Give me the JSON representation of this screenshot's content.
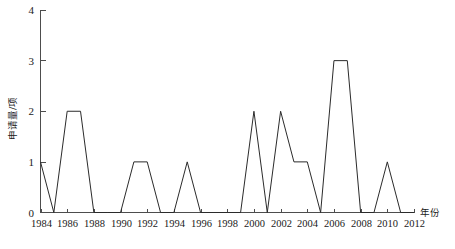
{
  "chart_data": {
    "type": "line",
    "title": "",
    "xlabel": "年份",
    "ylabel": "申请量/项",
    "xlim": [
      1984,
      2012
    ],
    "ylim": [
      0,
      4
    ],
    "grid": false,
    "legend": null,
    "x_tick_labels": [
      "1984",
      "1986",
      "1988",
      "1990",
      "1992",
      "1994",
      "1996",
      "1998",
      "2000",
      "2002",
      "2004",
      "2006",
      "2008",
      "2010",
      "2012"
    ],
    "y_tick_labels": [
      "0",
      "1",
      "2",
      "3",
      "4"
    ],
    "x": [
      1984,
      1985,
      1986,
      1987,
      1988,
      1989,
      1990,
      1991,
      1992,
      1993,
      1994,
      1995,
      1996,
      1997,
      1998,
      1999,
      2000,
      2001,
      2002,
      2003,
      2004,
      2005,
      2006,
      2007,
      2008,
      2009,
      2010,
      2011,
      2012
    ],
    "values": [
      1,
      0,
      2,
      2,
      0,
      0,
      0,
      1,
      1,
      0,
      0,
      1,
      0,
      0,
      0,
      0,
      2,
      0,
      2,
      1,
      1,
      0,
      3,
      3,
      0,
      0,
      1,
      0,
      0
    ],
    "series": [
      {
        "name": "申请量",
        "color": "#2b2b2b",
        "values": [
          1,
          0,
          2,
          2,
          0,
          0,
          0,
          1,
          1,
          0,
          0,
          1,
          0,
          0,
          0,
          0,
          2,
          0,
          2,
          1,
          1,
          0,
          3,
          3,
          0,
          0,
          1,
          0,
          0
        ]
      }
    ]
  },
  "axes": {
    "y_axis_name": "y-axis",
    "x_axis_name": "x-axis"
  }
}
